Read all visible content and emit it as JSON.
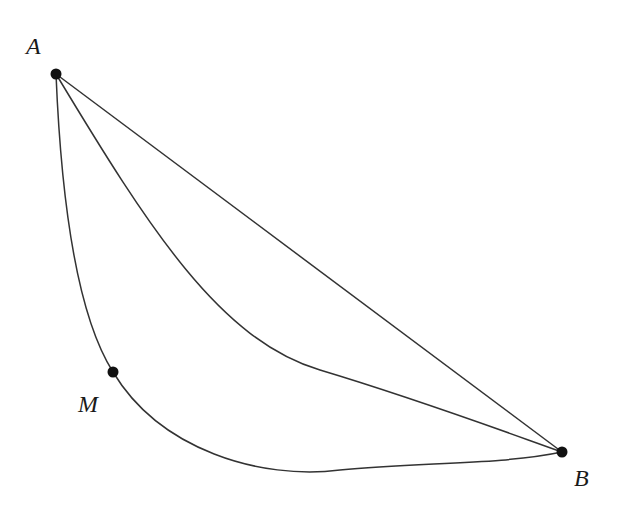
{
  "diagram": {
    "points": {
      "A": {
        "label": "A",
        "x": 56,
        "y": 74
      },
      "B": {
        "label": "B",
        "x": 562,
        "y": 452
      },
      "M": {
        "label": "M",
        "x": 113,
        "y": 372
      }
    },
    "curves": [
      {
        "name": "straight-line-AB",
        "type": "line"
      },
      {
        "name": "middle-curve-AB",
        "type": "curve"
      },
      {
        "name": "lower-curve-AMB",
        "type": "curve",
        "through": "M"
      }
    ],
    "colors": {
      "stroke": "#333333",
      "point": "#111111",
      "background": "#ffffff"
    }
  }
}
